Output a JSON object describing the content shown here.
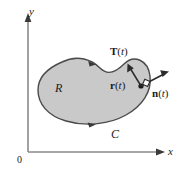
{
  "figure": {
    "colors": {
      "region_fill": "#c9c9c9",
      "region_stroke": "#4a4a4a",
      "axis": "#8a8a8a",
      "vector": "#2b2b2b",
      "text": "#1a1a1a",
      "background": "#ffffff"
    },
    "axes": {
      "x_label": "x",
      "y_label": "y",
      "origin_label": "0"
    },
    "labels": {
      "region": "R",
      "curve": "C",
      "tangent": {
        "symbol": "T",
        "arg_open": "(",
        "arg_var": "t",
        "arg_close": ")"
      },
      "position": {
        "symbol": "r",
        "arg_open": "(",
        "arg_var": "t",
        "arg_close": ")"
      },
      "normal": {
        "symbol": "n",
        "arg_open": "(",
        "arg_var": "t",
        "arg_close": ")"
      }
    },
    "annotations": {
      "right_angle_marker": "right-angle",
      "orientation": "counterclockwise"
    }
  }
}
